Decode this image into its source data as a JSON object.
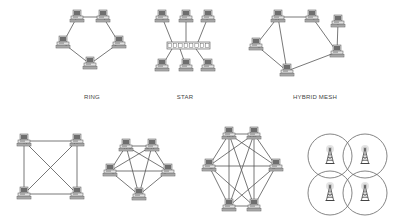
{
  "figure": {
    "title": "",
    "diagrams": [
      {
        "id": "ring",
        "label": "RING",
        "label_pos": [
          92,
          99
        ],
        "nodes": [
          [
            77,
            17
          ],
          [
            103,
            17
          ],
          [
            63,
            43
          ],
          [
            119,
            43
          ],
          [
            90,
            64
          ]
        ],
        "links": [
          [
            0,
            1
          ],
          [
            1,
            3
          ],
          [
            3,
            4
          ],
          [
            4,
            2
          ],
          [
            2,
            0
          ]
        ]
      },
      {
        "id": "star",
        "label": "STAR",
        "label_pos": [
          185,
          99
        ],
        "hub": {
          "x": 167,
          "y": 42,
          "w": 43,
          "h": 7,
          "ports": 8
        },
        "nodes": [
          [
            162,
            17
          ],
          [
            186,
            17
          ],
          [
            208,
            17
          ],
          [
            162,
            66
          ],
          [
            186,
            66
          ],
          [
            208,
            66
          ]
        ],
        "hub_links": [
          [
            0,
            [
              172,
              42
            ]
          ],
          [
            1,
            [
              186,
              42
            ]
          ],
          [
            2,
            [
              198,
              42
            ]
          ],
          [
            3,
            [
              172,
              49
            ]
          ],
          [
            4,
            [
              180,
              49
            ]
          ],
          [
            5,
            [
              196,
              49
            ]
          ]
        ]
      },
      {
        "id": "hybrid-mesh",
        "label": "HYBRID MESH",
        "label_pos": [
          315,
          99
        ],
        "nodes": [
          [
            278,
            17
          ],
          [
            312,
            17
          ],
          [
            338,
            22
          ],
          [
            256,
            45
          ],
          [
            337,
            52
          ],
          [
            287,
            71
          ]
        ],
        "links": [
          [
            0,
            1
          ],
          [
            0,
            3
          ],
          [
            0,
            5
          ],
          [
            1,
            4
          ],
          [
            2,
            4
          ],
          [
            3,
            5
          ],
          [
            5,
            4
          ]
        ]
      },
      {
        "id": "full-mesh-4",
        "label": "",
        "nodes": [
          [
            24,
            141
          ],
          [
            77,
            141
          ],
          [
            24,
            194
          ],
          [
            77,
            194
          ]
        ],
        "links": [
          [
            0,
            1
          ],
          [
            0,
            2
          ],
          [
            0,
            3
          ],
          [
            1,
            2
          ],
          [
            1,
            3
          ],
          [
            2,
            3
          ]
        ]
      },
      {
        "id": "full-mesh-5",
        "label": "",
        "nodes": [
          [
            126,
            146
          ],
          [
            152,
            146
          ],
          [
            110,
            171
          ],
          [
            168,
            171
          ],
          [
            139,
            195
          ]
        ],
        "links": [
          [
            0,
            1
          ],
          [
            0,
            2
          ],
          [
            0,
            3
          ],
          [
            0,
            4
          ],
          [
            1,
            2
          ],
          [
            1,
            3
          ],
          [
            1,
            4
          ],
          [
            2,
            3
          ],
          [
            2,
            4
          ],
          [
            3,
            4
          ]
        ]
      },
      {
        "id": "full-mesh-6",
        "label": "",
        "nodes": [
          [
            229,
            134
          ],
          [
            254,
            134
          ],
          [
            209,
            166
          ],
          [
            276,
            166
          ],
          [
            229,
            206
          ],
          [
            254,
            206
          ]
        ],
        "links": [
          [
            0,
            1
          ],
          [
            0,
            2
          ],
          [
            0,
            3
          ],
          [
            0,
            4
          ],
          [
            0,
            5
          ],
          [
            1,
            2
          ],
          [
            1,
            3
          ],
          [
            1,
            4
          ],
          [
            1,
            5
          ],
          [
            2,
            3
          ],
          [
            2,
            4
          ],
          [
            2,
            5
          ],
          [
            3,
            4
          ],
          [
            3,
            5
          ],
          [
            4,
            5
          ]
        ]
      },
      {
        "id": "wireless-mesh",
        "label": "",
        "cells": [
          {
            "cx": 330,
            "cy": 156,
            "r": 22
          },
          {
            "cx": 365,
            "cy": 156,
            "r": 22
          },
          {
            "cx": 330,
            "cy": 193,
            "r": 22
          },
          {
            "cx": 365,
            "cy": 193,
            "r": 22
          }
        ]
      }
    ],
    "colors": {
      "background": "#ffffff",
      "line": "#555555",
      "device_light": "#d8d8d8",
      "device_dark": "#6a6a6a",
      "text": "#444444"
    }
  }
}
